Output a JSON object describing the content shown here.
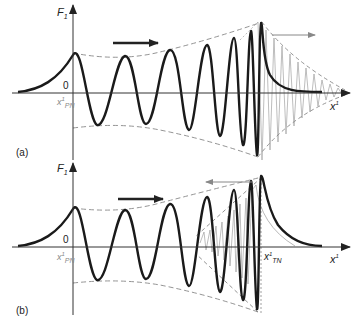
{
  "figure": {
    "panels": [
      {
        "tag": "(a)",
        "y_axis_label": "F",
        "y_axis_sub": "1",
        "x_axis_label": "x",
        "x_axis_sup": "1",
        "origin_label": "0",
        "point_label": "x",
        "point_sup": "1",
        "point_sub": "PN",
        "propagation_arrow": "right",
        "reflection_arrow": "right"
      },
      {
        "tag": "(b)",
        "y_axis_label": "F",
        "y_axis_sub": "1",
        "x_axis_label": "x",
        "x_axis_sup": "1",
        "origin_label": "0",
        "point_label": "x",
        "point_sup": "1",
        "point_sub": "PN",
        "point2_label": "x",
        "point2_sup": "1",
        "point2_sub": "TN",
        "propagation_arrow": "right",
        "reflection_arrow": "left"
      }
    ],
    "colors": {
      "curve": "#1a1a1a",
      "envelope": "#8a8a8a",
      "reflected": "#9a9a9a",
      "axis": "#333333"
    }
  }
}
